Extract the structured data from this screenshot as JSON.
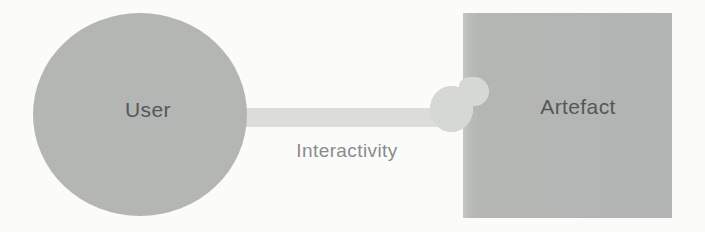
{
  "diagram": {
    "type": "node-link",
    "nodes": [
      {
        "id": "user",
        "label": "User",
        "shape": "circle"
      },
      {
        "id": "artefact",
        "label": "Artefact",
        "shape": "square"
      }
    ],
    "connector": {
      "label": "Interactivity",
      "from": "user",
      "to": "artefact",
      "style": "thick-bar-with-rounded-plug"
    },
    "colors": {
      "background": "#fbfbfa",
      "node_fill": "#b4b6b4",
      "connector_fill": "#dcddda",
      "plug_fill": "#d6d8d5",
      "node_label_text": "#54565a",
      "connector_label_text": "#8a8b8d"
    }
  }
}
